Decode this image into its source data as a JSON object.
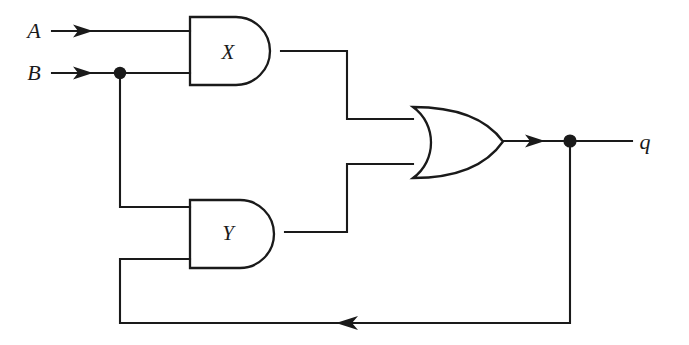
{
  "figure": {
    "kind": "logic-circuit-diagram",
    "title": "",
    "background_color": "#ffffff",
    "line_color": "#1a1a1a",
    "width": 689,
    "height": 345
  },
  "inputs": [
    {
      "id": "A",
      "label": "A",
      "label_x": 34,
      "label_y": 38,
      "wire_y": 31
    },
    {
      "id": "B",
      "label": "B",
      "label_x": 34,
      "label_y": 80,
      "wire_y": 73
    }
  ],
  "outputs": [
    {
      "id": "q",
      "label": "q",
      "label_x": 637,
      "label_y": 149,
      "wire_y": 141
    }
  ],
  "gates": [
    {
      "id": "X",
      "label": "X",
      "type": "AND",
      "label_x": 228,
      "label_y": 59,
      "left": 190,
      "top": 17,
      "bottom": 85,
      "tip_x": 281,
      "output_y": 51,
      "inputs_y": [
        31,
        73
      ]
    },
    {
      "id": "Y",
      "label": "Y",
      "type": "AND",
      "label_x": 228,
      "label_y": 240,
      "left": 190,
      "top": 200,
      "bottom": 268,
      "tip_x": 285,
      "output_y": 232,
      "inputs_y": [
        207,
        259
      ]
    },
    {
      "id": "OR1",
      "label": "",
      "type": "OR",
      "left": 413,
      "top": 107,
      "bottom": 178,
      "tip_x": 503,
      "output_y": 141,
      "inputs_y": [
        119,
        164
      ]
    }
  ],
  "junctions": [
    {
      "id": "b-tap",
      "x": 120,
      "y": 73
    },
    {
      "id": "q-tap",
      "x": 570,
      "y": 141
    }
  ],
  "arrowheads": [
    {
      "id": "a-input-arrow",
      "x": 86,
      "y": 31,
      "direction": "right"
    },
    {
      "id": "b-input-arrow",
      "x": 86,
      "y": 73,
      "direction": "right"
    },
    {
      "id": "q-output-arrow",
      "x": 538,
      "y": 141,
      "direction": "right"
    },
    {
      "id": "feedback-arrow",
      "x": 346,
      "y": 323,
      "direction": "left"
    }
  ],
  "wires": [
    {
      "id": "wire-a-to-x",
      "from": "A",
      "to": "X.in0",
      "path": "M 52 31 L 190 31"
    },
    {
      "id": "wire-b-to-x",
      "from": "B",
      "to": "X.in1",
      "path": "M 52 73 L 190 73"
    },
    {
      "id": "wire-b-tap-to-y",
      "from": "b-tap",
      "to": "Y.in0",
      "path": "M 120 73 L 120 207 L 190 207"
    },
    {
      "id": "wire-x-to-or",
      "from": "X.out",
      "to": "OR1.in0",
      "path": "M 281 51 L 347 51 L 347 119 L 413 119"
    },
    {
      "id": "wire-y-to-or",
      "from": "Y.out",
      "to": "OR1.in1",
      "path": "M 285 232 L 347 232 L 347 164 L 413 164"
    },
    {
      "id": "wire-or-to-q",
      "from": "OR1.out",
      "to": "q",
      "path": "M 503 141 L 632 141"
    },
    {
      "id": "wire-feedback",
      "from": "q-tap",
      "to": "Y.in1",
      "path": "M 570 141 L 570 323 L 120 323 L 120 259 L 190 259"
    }
  ]
}
